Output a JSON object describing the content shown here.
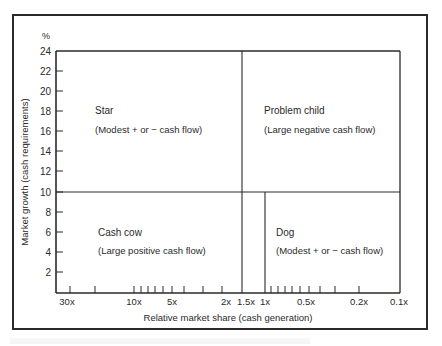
{
  "chart_data": {
    "type": "quadrant-matrix",
    "title": "",
    "ylabel": "Market growth (cash requirements)",
    "yunit": "%",
    "xlabel": "Relative market share (cash generation)",
    "ylim": [
      0,
      24
    ],
    "yticks": [
      2,
      4,
      6,
      8,
      10,
      12,
      14,
      16,
      18,
      20,
      22,
      24
    ],
    "xscale": "log, reversed",
    "xtick_labels": [
      "30x",
      "10x",
      "5x",
      "2x",
      "1.5x",
      "1x",
      "0.5x",
      "0.2x",
      "0.1x"
    ],
    "dividers": {
      "horizontal_at_growth": 10,
      "vertical_upper_at_share": "1.5x",
      "vertical_lower_at_share": "1x"
    },
    "quadrants": [
      {
        "name": "Star",
        "description": "(Modest + or − cash flow)",
        "position": "top-left"
      },
      {
        "name": "Problem child",
        "description": "(Large negative cash flow)",
        "position": "top-right"
      },
      {
        "name": "Cash cow",
        "description": "(Large positive cash flow)",
        "position": "bottom-left"
      },
      {
        "name": "Dog",
        "description": "(Modest + or − cash flow)",
        "position": "bottom-right"
      }
    ],
    "grid": false,
    "legend": null
  },
  "axis": {
    "y_unit": "%",
    "y_label": "Market growth (cash requirements)",
    "x_label": "Relative market share (cash generation)",
    "y_ticks": [
      {
        "label": "24",
        "y": 51
      },
      {
        "label": "22",
        "y": 71
      },
      {
        "label": "20",
        "y": 91
      },
      {
        "label": "18",
        "y": 111
      },
      {
        "label": "16",
        "y": 131
      },
      {
        "label": "14",
        "y": 151
      },
      {
        "label": "12",
        "y": 171
      },
      {
        "label": "10",
        "y": 192
      },
      {
        "label": "8",
        "y": 212
      },
      {
        "label": "6",
        "y": 232
      },
      {
        "label": "4",
        "y": 252
      },
      {
        "label": "2",
        "y": 272
      }
    ],
    "x_ticks": [
      {
        "label": "30x",
        "x": 67
      },
      {
        "label": "10x",
        "x": 134
      },
      {
        "label": "5x",
        "x": 172
      },
      {
        "label": "2x",
        "x": 226
      },
      {
        "label": "1.5x",
        "x": 246
      },
      {
        "label": "1x",
        "x": 265
      },
      {
        "label": "0.5x",
        "x": 306
      },
      {
        "label": "0.2x",
        "x": 359
      },
      {
        "label": "0.1x",
        "x": 399
      }
    ],
    "minor_tick_x": [
      70,
      95,
      134,
      141,
      148,
      155,
      163,
      172,
      184,
      203,
      222,
      271,
      278,
      285,
      292,
      300,
      309,
      320,
      335,
      359
    ]
  },
  "quadrants": {
    "star": {
      "title": "Star",
      "desc": "(Modest + or − cash flow)"
    },
    "problem_child": {
      "title": "Problem child",
      "desc": "(Large negative cash flow)"
    },
    "cash_cow": {
      "title": "Cash cow",
      "desc": "(Large positive cash flow)"
    },
    "dog": {
      "title": "Dog",
      "desc": "(Modest + or − cash flow)"
    }
  }
}
